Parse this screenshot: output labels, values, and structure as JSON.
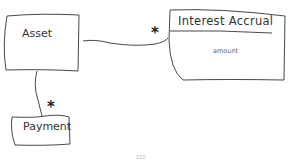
{
  "diagram": {
    "type": "uml-class-sketch",
    "classes": [
      {
        "id": "asset",
        "name": "Asset",
        "attributes": []
      },
      {
        "id": "interest-accrual",
        "name": "Interest Accrual",
        "attributes": [
          "amount"
        ]
      },
      {
        "id": "payment",
        "name": "Payment",
        "attributes": []
      }
    ],
    "associations": [
      {
        "from": "Asset",
        "to": "Interest Accrual",
        "multiplicity_to": "*"
      },
      {
        "from": "Asset",
        "to": "Payment",
        "multiplicity_to": "*"
      }
    ],
    "labels": {
      "asset": "Asset",
      "interest_accrual": "Interest Accrual",
      "interest_accrual_attr": "amount",
      "payment": "Payment",
      "mult_interest": "*",
      "mult_payment": "*",
      "caption": "ΞΞΞ"
    }
  }
}
